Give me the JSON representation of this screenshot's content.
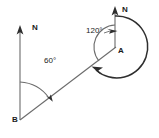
{
  "figure": {
    "stroke_color": "#3a3a3a",
    "label_color": "#1a1a1a",
    "background": "#ffffff",
    "points": {
      "B": {
        "label": "B",
        "x": 20,
        "y": 120
      },
      "A": {
        "label": "A",
        "x": 115,
        "y": 47
      }
    },
    "north_arrows": [
      {
        "label": "N",
        "at": "B",
        "x": 20,
        "y_top": 27,
        "y_bottom": 120
      },
      {
        "label": "N",
        "at": "A",
        "x": 115,
        "y_top": 8,
        "y_bottom": 47
      }
    ],
    "angles": [
      {
        "label": "60°",
        "vertex": "B",
        "value": 60,
        "unit": "degrees",
        "sweep": "clockwise-from-north"
      },
      {
        "label": "120°",
        "vertex": "A",
        "value": 120,
        "unit": "degrees",
        "sweep": "anticlockwise-from-north"
      }
    ],
    "reflex_arc": {
      "vertex": "A",
      "value": 240,
      "unit": "degrees",
      "sweep": "clockwise"
    },
    "segments": [
      {
        "from": "B",
        "to": "A"
      }
    ]
  }
}
